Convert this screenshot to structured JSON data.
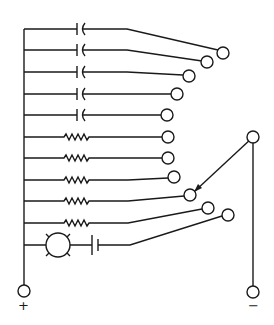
{
  "diagram": {
    "type": "electrical-schematic",
    "colors": {
      "line": "#1a1a1a",
      "background": "#ffffff"
    },
    "terminals": {
      "positive": {
        "label": "+"
      },
      "negative": {
        "label": "−"
      }
    },
    "branches": [
      {
        "index": 1,
        "component": "capacitor"
      },
      {
        "index": 2,
        "component": "capacitor"
      },
      {
        "index": 3,
        "component": "capacitor"
      },
      {
        "index": 4,
        "component": "capacitor"
      },
      {
        "index": 5,
        "component": "capacitor"
      },
      {
        "index": 6,
        "component": "resistor"
      },
      {
        "index": 7,
        "component": "resistor"
      },
      {
        "index": 8,
        "component": "resistor"
      },
      {
        "index": 9,
        "component": "resistor"
      },
      {
        "index": 10,
        "component": "resistor"
      },
      {
        "index": 11,
        "component": "lamp + cell"
      }
    ],
    "selector": {
      "arm_points_to_branch": 9
    }
  }
}
